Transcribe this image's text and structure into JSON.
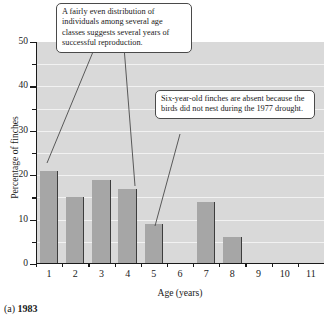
{
  "chart_data": {
    "type": "bar",
    "title": "",
    "xlabel": "Age (years)",
    "ylabel": "Percentage of finches",
    "categories": [
      "1",
      "2",
      "3",
      "4",
      "5",
      "6",
      "7",
      "8",
      "9",
      "10",
      "11"
    ],
    "values": [
      21,
      15,
      19,
      17,
      9,
      0,
      14,
      6,
      0,
      0,
      0
    ],
    "ylim": [
      0,
      50
    ],
    "yticks": [
      0,
      10,
      20,
      30,
      40,
      50
    ],
    "ytick_labels": [
      "0",
      "10",
      "20",
      "30",
      "40",
      "50"
    ],
    "yminor_ticks": [
      5,
      15,
      25,
      35,
      45
    ],
    "grid": true,
    "grid_values": [
      5,
      10,
      15,
      20,
      25,
      30,
      35,
      40,
      45
    ],
    "legend": "none",
    "bar_color": "#a6a6a6",
    "plot_background": "#d9d9d9",
    "gridline_color": "#f2f2f2",
    "annotations": [
      {
        "id": "reproduction",
        "text": "A fairly even distribution of individuals among several age classes suggests several years of successful reproduction.",
        "points_to": [
          "1",
          "4"
        ]
      },
      {
        "id": "drought",
        "text": "Six-year-old finches are absent because the birds did not nest during the 1977 drought.",
        "points_to": [
          "6"
        ]
      }
    ]
  },
  "caption": {
    "label": "(a)",
    "year": "1983"
  }
}
